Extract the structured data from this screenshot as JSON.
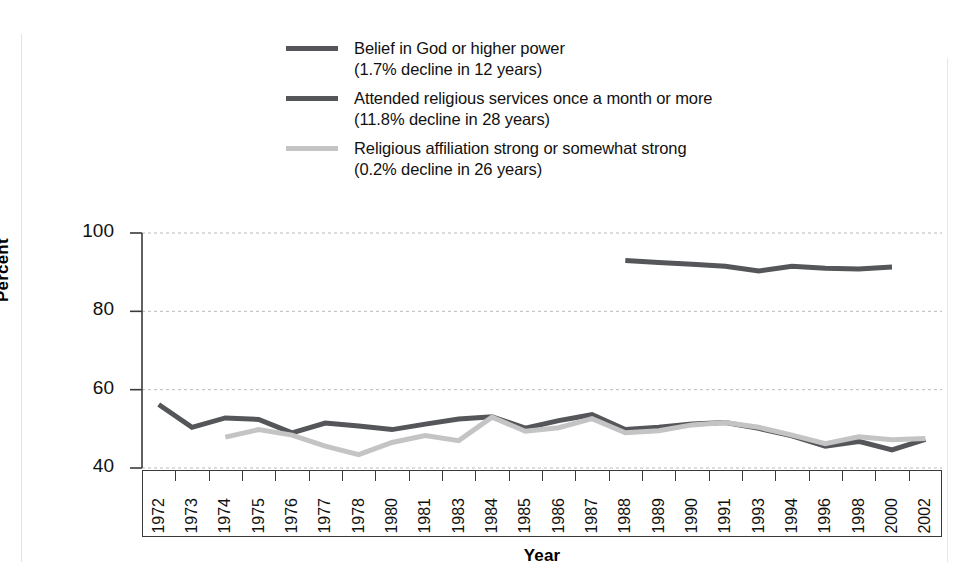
{
  "legend": {
    "items": [
      {
        "label": "Belief in God or higher power",
        "sublabel": "(1.7% decline in 12 years)",
        "text": "Belief in God or higher power\n(1.7% decline in 12 years)",
        "color": "#55565a",
        "swatch_name": "legend-swatch-belief"
      },
      {
        "label": "Attended religious services once a month or more",
        "sublabel": "(11.8% decline in 28 years)",
        "text": "Attended religious services once a month or more\n(11.8% decline in 28 years)",
        "color": "#55565a",
        "swatch_name": "legend-swatch-attendance"
      },
      {
        "label": "Religious affiliation strong or somewhat strong",
        "sublabel": "(0.2% decline in 26 years)",
        "text": "Religious affiliation strong or somewhat strong\n(0.2% decline in 26 years)",
        "color": "#c4c4c4",
        "swatch_name": "legend-swatch-affiliation"
      }
    ]
  },
  "chart_data": {
    "type": "line",
    "title": "",
    "xlabel": "Year",
    "ylabel": "Percent",
    "ylim": [
      40,
      100
    ],
    "yticks": [
      40,
      60,
      80,
      100
    ],
    "grid": "horizontal-dashed",
    "legend_position": "top-left-above-plot",
    "categories": [
      "1972",
      "1973",
      "1974",
      "1975",
      "1976",
      "1977",
      "1978",
      "1980",
      "1981",
      "1983",
      "1984",
      "1985",
      "1986",
      "1987",
      "1988",
      "1989",
      "1990",
      "1991",
      "1993",
      "1994",
      "1996",
      "1998",
      "2000",
      "2002"
    ],
    "series": [
      {
        "name": "Belief in God or higher power",
        "color": "#55565a",
        "values": [
          null,
          null,
          null,
          null,
          null,
          null,
          null,
          null,
          null,
          null,
          null,
          null,
          null,
          null,
          93.0,
          92.5,
          92.0,
          91.5,
          90.3,
          91.5,
          91.0,
          90.8,
          91.3,
          null
        ]
      },
      {
        "name": "Attended religious services once a month or more",
        "color": "#55565a",
        "values": [
          56.2,
          50.4,
          52.8,
          52.4,
          49.0,
          51.5,
          50.7,
          49.8,
          51.2,
          52.5,
          53.1,
          50.2,
          52.1,
          53.6,
          49.8,
          50.4,
          51.2,
          51.6,
          50.1,
          48.2,
          45.6,
          46.8,
          44.6,
          47.3
        ]
      },
      {
        "name": "Religious affiliation strong or somewhat strong",
        "color": "#c4c4c4",
        "values": [
          null,
          null,
          47.9,
          49.8,
          48.4,
          45.6,
          43.4,
          46.5,
          48.3,
          47.0,
          53.0,
          49.4,
          50.3,
          52.6,
          49.0,
          49.5,
          51.0,
          51.6,
          50.4,
          48.4,
          46.2,
          48.0,
          47.2,
          47.5
        ]
      }
    ]
  }
}
